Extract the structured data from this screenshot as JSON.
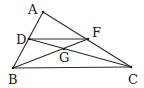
{
  "figure": {
    "type": "geometry-triangle",
    "points": {
      "A": {
        "label": "A",
        "x": 43,
        "y": 12,
        "lx": 28,
        "ly": 14
      },
      "B": {
        "label": "B",
        "x": 13,
        "y": 68,
        "lx": 8,
        "ly": 84
      },
      "C": {
        "label": "C",
        "x": 131,
        "y": 67,
        "lx": 128,
        "ly": 84
      },
      "D": {
        "label": "D",
        "x": 29,
        "y": 39,
        "lx": 16,
        "ly": 44
      },
      "F": {
        "label": "F",
        "x": 88,
        "y": 39,
        "lx": 92,
        "ly": 37
      },
      "G": {
        "label": "G",
        "x": 64,
        "y": 49,
        "lx": 59,
        "ly": 62
      }
    },
    "segments": [
      [
        "A",
        "B"
      ],
      [
        "A",
        "C"
      ],
      [
        "B",
        "C"
      ],
      [
        "D",
        "F"
      ],
      [
        "D",
        "C"
      ],
      [
        "B",
        "F"
      ]
    ],
    "stroke_color": "#2a2a2a"
  }
}
